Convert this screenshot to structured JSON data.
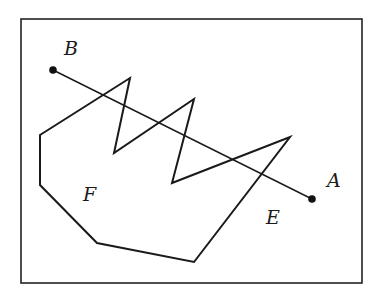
{
  "diagram": {
    "frame": {
      "x": 21,
      "y": 19,
      "width": 341,
      "height": 264,
      "stroke": "#222222"
    },
    "polygon": {
      "points": [
        [
          40,
          135
        ],
        [
          130,
          78
        ],
        [
          114,
          153
        ],
        [
          194,
          99
        ],
        [
          172,
          183
        ],
        [
          290,
          137
        ],
        [
          194,
          262
        ],
        [
          97,
          243
        ],
        [
          40,
          185
        ]
      ],
      "stroke": "#1a1a1a"
    },
    "segment": {
      "from": "B",
      "to": "A"
    },
    "points": {
      "A": {
        "label": "A",
        "x": 312,
        "y": 199,
        "label_x": 327,
        "label_y": 187
      },
      "B": {
        "label": "B",
        "x": 53,
        "y": 70,
        "label_x": 64,
        "label_y": 55
      }
    },
    "regions": {
      "E": {
        "label": "E",
        "x": 266,
        "y": 224
      },
      "F": {
        "label": "F",
        "x": 83,
        "y": 201
      }
    }
  }
}
